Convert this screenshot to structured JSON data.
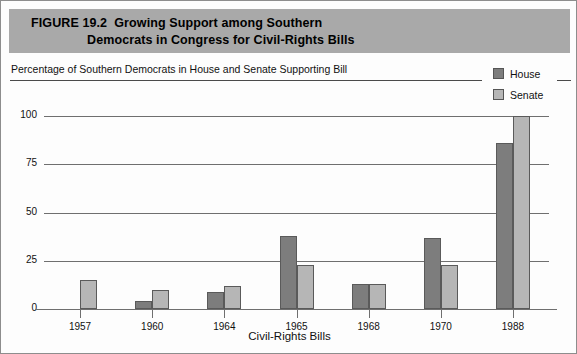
{
  "figure": {
    "number": "FIGURE 19.2",
    "title_line1": "Growing Support among Southern",
    "title_line2": "Democrats in Congress for Civil-Rights Bills",
    "subtitle": "Percentage of Southern Democrats in House and Senate Supporting Bill"
  },
  "legend": {
    "items": [
      {
        "label": "House",
        "color": "#7d7d7d"
      },
      {
        "label": "Senate",
        "color": "#b6b6b6"
      }
    ]
  },
  "axes": {
    "y_ticks": [
      "100",
      "75",
      "50",
      "25",
      "0"
    ],
    "x_label": "Civil-Rights Bills"
  },
  "chart_data": {
    "type": "bar",
    "title": "Growing Support among Southern Democrats in Congress for Civil-Rights Bills",
    "subtitle": "Percentage of Southern Democrats in House and Senate Supporting Bill",
    "xlabel": "Civil-Rights Bills",
    "ylabel": "",
    "ylim": [
      0,
      100
    ],
    "yticks": [
      0,
      25,
      50,
      75,
      100
    ],
    "grid": true,
    "legend_position": "top-right",
    "categories": [
      "1957",
      "1960",
      "1964",
      "1965",
      "1968",
      "1970",
      "1988"
    ],
    "series": [
      {
        "name": "House",
        "color": "#7d7d7d",
        "values": [
          0,
          4,
          9,
          38,
          13,
          37,
          86
        ]
      },
      {
        "name": "Senate",
        "color": "#b6b6b6",
        "values": [
          15,
          10,
          12,
          23,
          13,
          23,
          100
        ]
      }
    ]
  }
}
